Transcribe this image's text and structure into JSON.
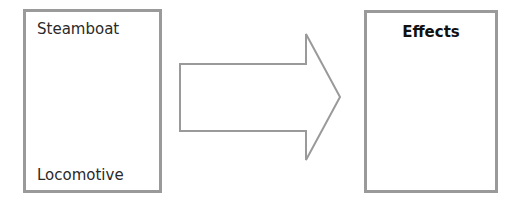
{
  "diagram": {
    "left_box": {
      "items": [
        "Steamboat",
        "Locomotive"
      ]
    },
    "arrow": {
      "direction": "right"
    },
    "right_box": {
      "title": "Effects"
    }
  },
  "colors": {
    "border": "#9a9a9a",
    "text": "#2a2a2a",
    "background": "#ffffff"
  }
}
